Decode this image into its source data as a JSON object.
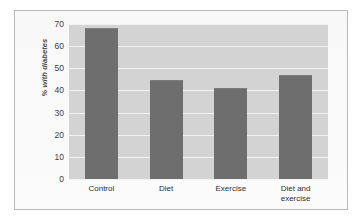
{
  "chart_data": {
    "type": "bar",
    "title": "",
    "xlabel": "",
    "ylabel": "% with diabetes",
    "categories": [
      "Control",
      "Diet",
      "Exercise",
      "Diet and\nexercise"
    ],
    "values": [
      68,
      44.5,
      41,
      47
    ],
    "ylim": [
      0,
      70
    ],
    "yticks": [
      0,
      10,
      20,
      30,
      40,
      50,
      60,
      70
    ],
    "ytick_labels": [
      "0",
      "10",
      "20",
      "30",
      "40",
      "50",
      "60",
      "70"
    ],
    "grid": "horizontal",
    "legend": "none",
    "colors": {
      "bar": "#6e6e6e",
      "plot_background": "#d3d3d3",
      "gridline": "#f2f2f2",
      "frame_background": "#fbfbfb",
      "frame_border": "#b9b9b9",
      "text": "#2f2f2f"
    }
  }
}
